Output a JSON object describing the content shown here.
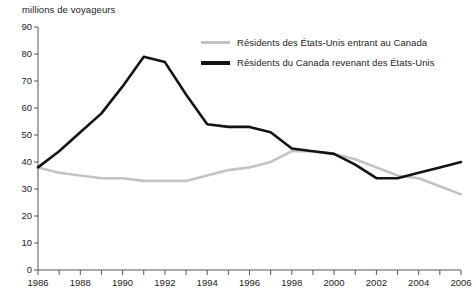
{
  "chart_data": {
    "type": "line",
    "title": "",
    "ylabel": "millions de voyageurs",
    "xlabel": "",
    "ylim": [
      0,
      90
    ],
    "ytick_step": 10,
    "yticks": [
      0,
      10,
      20,
      30,
      40,
      50,
      60,
      70,
      80,
      90
    ],
    "xlim": [
      1986,
      2006
    ],
    "xticks_labeled": [
      1986,
      1988,
      1990,
      1992,
      1994,
      1996,
      1998,
      2000,
      2002,
      2004,
      2006
    ],
    "x": [
      1986,
      1987,
      1988,
      1989,
      1990,
      1991,
      1992,
      1993,
      1994,
      1995,
      1996,
      1997,
      1998,
      1999,
      2000,
      2001,
      2002,
      2003,
      2004,
      2005,
      2006
    ],
    "grid": false,
    "legend_position": "upper-right-inside",
    "series": [
      {
        "name": "Résidents des États-Unis entrant au Canada",
        "color": "#c3c3c3",
        "values": [
          38,
          36,
          35,
          34,
          34,
          33,
          33,
          33,
          35,
          37,
          38,
          40,
          44,
          44,
          43,
          41,
          38,
          35,
          34,
          31,
          28
        ]
      },
      {
        "name": "Résidents du Canada revenant des États-Unis",
        "color": "#141414",
        "values": [
          38,
          44,
          51,
          58,
          68,
          79,
          77,
          65,
          54,
          53,
          53,
          51,
          45,
          44,
          43,
          39,
          34,
          34,
          36,
          38,
          40
        ]
      }
    ]
  },
  "legend": {
    "items": [
      {
        "label": "Résidents des États-Unis entrant au Canada",
        "style": "grey"
      },
      {
        "label": "Résidents du Canada revenant des États-Unis",
        "style": "black"
      }
    ]
  }
}
